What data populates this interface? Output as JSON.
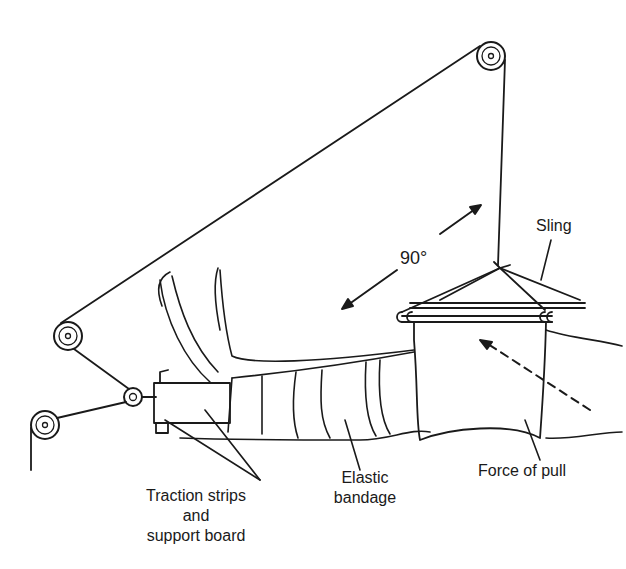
{
  "diagram": {
    "type": "medical-illustration",
    "stroke_color": "#1a1a1a",
    "background": "#ffffff"
  },
  "labels": {
    "angle": "90°",
    "sling": "Sling",
    "force_of_pull": "Force of pull",
    "elastic_bandage_line1": "Elastic",
    "elastic_bandage_line2": "bandage",
    "traction_line1": "Traction strips",
    "traction_line2": "and",
    "traction_line3": "support board"
  }
}
